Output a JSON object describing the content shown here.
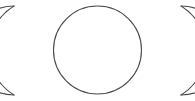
{
  "canvas": {
    "width": 195,
    "height": 101,
    "background_color": "#ffffff"
  },
  "symbol": {
    "name": "triple-moon",
    "alt_name": "Triple Goddess symbol",
    "stroke_color": "#4a4a4a",
    "stroke_width": 1.1,
    "fill": "none",
    "parts": [
      {
        "id": "left-crescent",
        "label": "waxing crescent",
        "horns_direction": "right",
        "horn_tip_top": [
          14,
          6
        ],
        "horn_tip_bottom": [
          14,
          95
        ],
        "outer_extent_x": 15,
        "inner_edge": "shared with central circle"
      },
      {
        "id": "center-circle",
        "label": "full moon",
        "center": [
          97.5,
          50
        ],
        "radius": 44,
        "bounds": [
          53.5,
          6,
          141.5,
          94
        ]
      },
      {
        "id": "right-crescent",
        "label": "waning crescent",
        "horns_direction": "left",
        "horn_tip_top": [
          181,
          6
        ],
        "horn_tip_bottom": [
          181,
          95
        ],
        "outer_extent_x": 163,
        "inner_edge": "shared with central circle"
      }
    ]
  },
  "geometry": {
    "left_outer_arc_path": "M 14 6 A 52 52 0 0 0 14 95",
    "left_inner_arc_path": "M 14 6 A 44 44 0 0 0 14 95",
    "center_circle_cx": 97.5,
    "center_circle_cy": 50,
    "center_circle_r": 44,
    "right_outer_arc_path": "M 181 6 A 52 52 0 0 1 181 95",
    "right_inner_arc_path": "M 181 6 A 44 44 0 0 1 181 95"
  }
}
